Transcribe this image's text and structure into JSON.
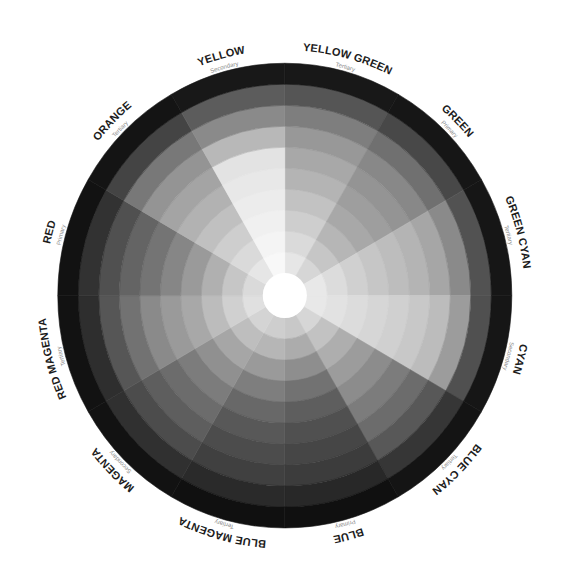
{
  "wheel": {
    "ring_count": 10,
    "hub_color": "#ffffff",
    "background": "#ffffff",
    "sectors": [
      {
        "id": "yellow-green",
        "label": "YELLOW GREEN",
        "type": "Tertiary",
        "start_deg": 0,
        "end_deg": 30,
        "rings": [
          "#e6e6e6",
          "#dadada",
          "#cecece",
          "#c2c2c2",
          "#b4b4b4",
          "#a8a8a8",
          "#989898",
          "#7e7e7e",
          "#555555",
          "#181818"
        ]
      },
      {
        "id": "green",
        "label": "GREEN",
        "type": "Primary",
        "start_deg": 30,
        "end_deg": 60,
        "rings": [
          "#d6d6d6",
          "#c6c6c6",
          "#b6b6b6",
          "#a8a8a8",
          "#9e9e9e",
          "#949494",
          "#888888",
          "#707070",
          "#484848",
          "#161616"
        ]
      },
      {
        "id": "green-cyan",
        "label": "GREEN CYAN",
        "type": "Tertiary",
        "start_deg": 60,
        "end_deg": 90,
        "rings": [
          "#e8e8e8",
          "#dcdcdc",
          "#d0d0d0",
          "#c6c6c6",
          "#bdbdbd",
          "#b4b4b4",
          "#a6a6a6",
          "#8a8a8a",
          "#525252",
          "#161616"
        ]
      },
      {
        "id": "cyan",
        "label": "CYAN",
        "type": "Secondary",
        "start_deg": 90,
        "end_deg": 120,
        "rings": [
          "#e8e8e8",
          "#e2e2e2",
          "#dcdcdc",
          "#d6d6d6",
          "#d0d0d0",
          "#c8c8c8",
          "#bcbcbc",
          "#9c9c9c",
          "#505050",
          "#161616"
        ]
      },
      {
        "id": "blue-cyan",
        "label": "BLUE CYAN",
        "type": "Tertiary",
        "start_deg": 120,
        "end_deg": 150,
        "rings": [
          "#d6d6d6",
          "#c2c2c2",
          "#aeaeae",
          "#9c9c9c",
          "#8c8c8c",
          "#7c7c7c",
          "#6c6c6c",
          "#585858",
          "#363636",
          "#141414"
        ]
      },
      {
        "id": "blue",
        "label": "BLUE",
        "type": "Primary",
        "start_deg": 150,
        "end_deg": 180,
        "rings": [
          "#c8c8c8",
          "#acacac",
          "#8e8e8e",
          "#727272",
          "#5e5e5e",
          "#505050",
          "#464646",
          "#3c3c3c",
          "#282828",
          "#101010"
        ]
      },
      {
        "id": "blue-magenta",
        "label": "BLUE MAGENTA",
        "type": "Tertiary",
        "start_deg": 180,
        "end_deg": 210,
        "rings": [
          "#cecece",
          "#b6b6b6",
          "#9a9a9a",
          "#7e7e7e",
          "#686868",
          "#585858",
          "#4c4c4c",
          "#404040",
          "#2a2a2a",
          "#101010"
        ]
      },
      {
        "id": "magenta",
        "label": "MAGENTA",
        "type": "Secondary",
        "start_deg": 210,
        "end_deg": 240,
        "rings": [
          "#d4d4d4",
          "#bebebe",
          "#a6a6a6",
          "#909090",
          "#7c7c7c",
          "#6c6c6c",
          "#5e5e5e",
          "#4c4c4c",
          "#303030",
          "#121212"
        ]
      },
      {
        "id": "red-magenta",
        "label": "RED MAGENTA",
        "type": "Tertiary",
        "start_deg": 240,
        "end_deg": 270,
        "rings": [
          "#e0e0e0",
          "#d0d0d0",
          "#bcbcbc",
          "#a8a8a8",
          "#9a9a9a",
          "#8a8a8a",
          "#727272",
          "#565656",
          "#2e2e2e",
          "#121212"
        ]
      },
      {
        "id": "red",
        "label": "RED",
        "type": "Primary",
        "start_deg": 270,
        "end_deg": 300,
        "rings": [
          "#dadada",
          "#c6c6c6",
          "#b0b0b0",
          "#9a9a9a",
          "#868686",
          "#747474",
          "#646464",
          "#505050",
          "#323232",
          "#121212"
        ]
      },
      {
        "id": "orange",
        "label": "ORANGE",
        "type": "Tertiary",
        "start_deg": 300,
        "end_deg": 330,
        "rings": [
          "#e6e6e6",
          "#dadada",
          "#cecece",
          "#c0c0c0",
          "#b2b2b2",
          "#a4a4a4",
          "#949494",
          "#787878",
          "#444444",
          "#141414"
        ]
      },
      {
        "id": "yellow",
        "label": "YELLOW",
        "type": "Secondary",
        "start_deg": 330,
        "end_deg": 360,
        "rings": [
          "#f8f8f8",
          "#f4f4f4",
          "#f0f0f0",
          "#ececec",
          "#e8e8e8",
          "#e3e3e3",
          "#b8b8b8",
          "#8a8a8a",
          "#5c5c5c",
          "#181818"
        ]
      }
    ]
  }
}
